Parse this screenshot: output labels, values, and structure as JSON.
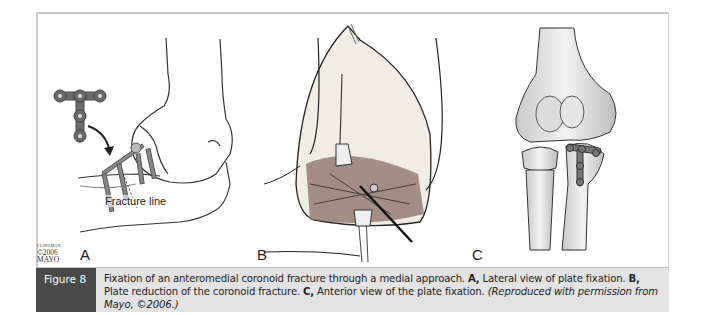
{
  "figure": {
    "tag": "Figure 8",
    "caption": {
      "lead": "Fixation of an anteromedial coronoid fracture through a medial approach.",
      "label_a": "A,",
      "text_a": "Lateral view of plate fixation.",
      "label_b": "B,",
      "text_b": "Plate reduction of the coronoid fracture.",
      "label_c": "C,",
      "text_c": "Anterior view of the plate fixation.",
      "credit": "(Reproduced with permission from Mayo, ©2006.)"
    },
    "colors": {
      "caption_tag_bg": "#4a4a4a",
      "caption_bg": "#e3e3e3",
      "frame": "#c9c9c9"
    }
  },
  "panels": {
    "a": {
      "label": "A",
      "annotation": "Fracture line",
      "copyright_small": "CLINGMAN",
      "copyright_year": "©2006",
      "copyright_owner": "MAYO"
    },
    "b": {
      "label": "B"
    },
    "c": {
      "label": "C"
    }
  }
}
